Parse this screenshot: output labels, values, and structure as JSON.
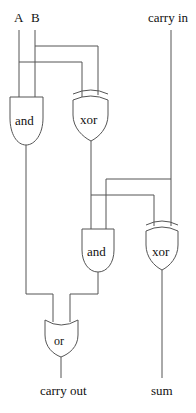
{
  "inputs": {
    "a": "A",
    "b": "B",
    "carry_in": "carry in"
  },
  "gates": [
    {
      "id": "and1",
      "type": "and",
      "label": "and"
    },
    {
      "id": "xor1",
      "type": "xor",
      "label": "xor"
    },
    {
      "id": "and2",
      "type": "and",
      "label": "and"
    },
    {
      "id": "xor2",
      "type": "xor",
      "label": "xor"
    },
    {
      "id": "or1",
      "type": "or",
      "label": "or"
    }
  ],
  "outputs": {
    "carry_out": "carry out",
    "sum": "sum"
  },
  "colors": {
    "wire": "#555555",
    "text": "#111111",
    "background": "#ffffff"
  }
}
